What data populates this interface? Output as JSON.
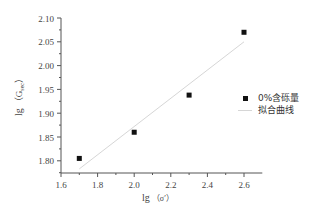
{
  "chart_data": {
    "type": "scatter",
    "title": "",
    "xlabel": "lg（σ′）",
    "ylabel": "lg（G_sec）",
    "xlim": [
      1.6,
      2.7
    ],
    "ylim": [
      1.775,
      2.1
    ],
    "x_ticks": [
      "1.6",
      "1.8",
      "2.0",
      "2.2",
      "2.4",
      "2.6"
    ],
    "y_ticks": [
      "1.80",
      "1.85",
      "1.90",
      "1.95",
      "2.00",
      "2.05",
      "2.10"
    ],
    "grid": false,
    "legend_position": "right",
    "series": [
      {
        "name": "0%含砾量",
        "type": "scatter",
        "marker": "square",
        "color": "#111111",
        "x": [
          1.7,
          2.0,
          2.3,
          2.6
        ],
        "y": [
          1.805,
          1.86,
          1.938,
          2.07
        ]
      },
      {
        "name": "拟合曲线",
        "type": "line",
        "color": "#d6d6d6",
        "x": [
          1.7,
          2.6
        ],
        "y": [
          1.783,
          2.05
        ]
      }
    ]
  },
  "axes": {
    "xlabel_main": "lg",
    "xlabel_paren": "（σ′）",
    "ylabel_main": "lg",
    "ylabel_paren": "（G",
    "ylabel_sub": "sec",
    "ylabel_close": "）"
  },
  "legend": {
    "items": [
      {
        "label": "0%含砾量",
        "symbol": "square"
      },
      {
        "label": "拟合曲线",
        "symbol": "line"
      }
    ]
  }
}
